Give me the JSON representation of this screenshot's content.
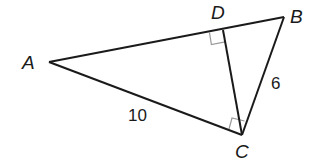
{
  "figure": {
    "type": "right-triangle-with-altitude",
    "colors": {
      "line": "#1a1a1a",
      "right_angle_mark": "#9a9a9a",
      "background": "#ffffff"
    },
    "vertices": {
      "A": {
        "label": "A",
        "x": 49,
        "y": 62
      },
      "B": {
        "label": "B",
        "x": 284,
        "y": 17
      },
      "C": {
        "label": "C",
        "x": 242,
        "y": 135
      },
      "D": {
        "label": "D",
        "x": 223,
        "y": 30
      }
    },
    "segments": [
      {
        "from": "A",
        "to": "B"
      },
      {
        "from": "A",
        "to": "C"
      },
      {
        "from": "B",
        "to": "C"
      },
      {
        "from": "C",
        "to": "D"
      }
    ],
    "right_angles": [
      "D",
      "C"
    ],
    "measurements": {
      "AC": "10",
      "BC": "6"
    }
  }
}
